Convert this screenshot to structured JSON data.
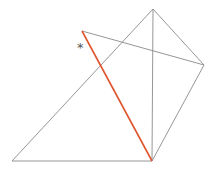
{
  "diagram": {
    "points": {
      "top": [
        153,
        9
      ],
      "upper_left": [
        82,
        31
      ],
      "right": [
        204,
        65
      ],
      "bottom": [
        152,
        161
      ],
      "bottom_left": [
        12,
        161
      ]
    },
    "edges": [
      {
        "from": "bottom_left",
        "to": "top",
        "color": "#8a8a8a"
      },
      {
        "from": "top",
        "to": "right",
        "color": "#8a8a8a"
      },
      {
        "from": "right",
        "to": "bottom",
        "color": "#8a8a8a"
      },
      {
        "from": "bottom",
        "to": "bottom_left",
        "color": "#8a8a8a"
      },
      {
        "from": "top",
        "to": "bottom",
        "color": "#8a8a8a"
      },
      {
        "from": "upper_left",
        "to": "right",
        "color": "#8a8a8a"
      },
      {
        "from": "upper_left",
        "to": "bottom",
        "color": "#e0552f",
        "highlight": true
      }
    ],
    "marker": {
      "text": "*",
      "x": 77,
      "y": 41
    }
  }
}
